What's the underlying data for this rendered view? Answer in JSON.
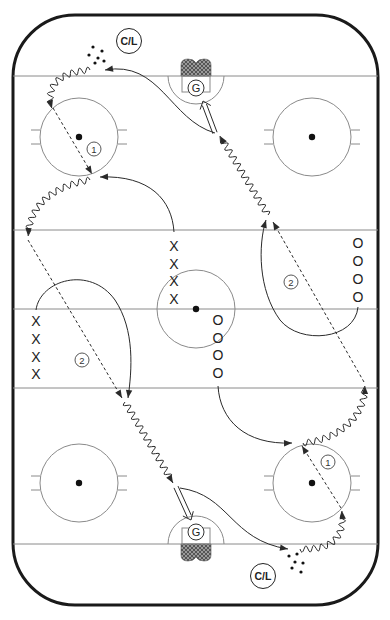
{
  "diagram": {
    "type": "hockey-drill",
    "canvas": {
      "width": 390,
      "height": 620,
      "background": "#ffffff"
    },
    "colors": {
      "boards": "#1a1a1a",
      "rink_lines": "#8a8a8a",
      "paths": "#2a2a2a",
      "net_fill": "#6a6a6a",
      "dot": "#111111"
    },
    "rink": {
      "x": 13,
      "y": 15,
      "width": 365,
      "height": 590,
      "corner_radius": 62
    },
    "lines": [
      {
        "name": "goal-line-top",
        "y": 76
      },
      {
        "name": "blue-line-top",
        "y": 230
      },
      {
        "name": "center-line",
        "y": 309
      },
      {
        "name": "blue-line-bottom",
        "y": 388
      },
      {
        "name": "goal-line-bottom",
        "y": 544
      }
    ],
    "faceoff_circles": [
      {
        "name": "faceoff-circle-top-left",
        "cx": 79,
        "cy": 137,
        "r": 39
      },
      {
        "name": "faceoff-circle-top-right",
        "cx": 312,
        "cy": 137,
        "r": 39
      },
      {
        "name": "faceoff-circle-bottom-left",
        "cx": 79,
        "cy": 483,
        "r": 39
      },
      {
        "name": "faceoff-circle-bottom-right",
        "cx": 312,
        "cy": 483,
        "r": 39
      }
    ],
    "center_circle": {
      "cx": 196,
      "cy": 309,
      "r": 39
    },
    "goals": [
      {
        "name": "goal-top",
        "cx": 196,
        "goal_line_y": 76,
        "dir": 1,
        "goalie_label": "G"
      },
      {
        "name": "goal-bottom",
        "cx": 196,
        "goal_line_y": 544,
        "dir": -1,
        "goalie_label": "G"
      }
    ],
    "coach_markers": [
      {
        "name": "coach-top",
        "label": "C/L",
        "cx": 129,
        "cy": 41
      },
      {
        "name": "coach-bottom",
        "label": "C/L",
        "cx": 263,
        "cy": 576
      }
    ],
    "puck_piles": [
      {
        "name": "pucks-top",
        "dots": [
          [
            93,
            47
          ],
          [
            102,
            51
          ],
          [
            89,
            55
          ],
          [
            98,
            58
          ],
          [
            95,
            63
          ],
          [
            104,
            61
          ]
        ]
      },
      {
        "name": "pucks-bottom",
        "dots": [
          [
            289,
            556
          ],
          [
            297,
            554
          ],
          [
            295,
            562
          ],
          [
            303,
            563
          ],
          [
            292,
            568
          ],
          [
            301,
            572
          ]
        ]
      }
    ],
    "players": [
      {
        "team": "X",
        "label": "X",
        "x": 174,
        "y": 246
      },
      {
        "team": "X",
        "label": "X",
        "x": 174,
        "y": 264
      },
      {
        "team": "X",
        "label": "X",
        "x": 174,
        "y": 281
      },
      {
        "team": "X",
        "label": "X",
        "x": 174,
        "y": 299
      },
      {
        "team": "X",
        "label": "X",
        "x": 36,
        "y": 321
      },
      {
        "team": "X",
        "label": "X",
        "x": 36,
        "y": 339
      },
      {
        "team": "X",
        "label": "X",
        "x": 36,
        "y": 357
      },
      {
        "team": "X",
        "label": "X",
        "x": 36,
        "y": 374
      },
      {
        "team": "O",
        "label": "O",
        "x": 218,
        "y": 320
      },
      {
        "team": "O",
        "label": "O",
        "x": 218,
        "y": 338
      },
      {
        "team": "O",
        "label": "O",
        "x": 218,
        "y": 355
      },
      {
        "team": "O",
        "label": "O",
        "x": 218,
        "y": 373
      },
      {
        "team": "O",
        "label": "O",
        "x": 358,
        "y": 243
      },
      {
        "team": "O",
        "label": "O",
        "x": 358,
        "y": 261
      },
      {
        "team": "O",
        "label": "O",
        "x": 358,
        "y": 279
      },
      {
        "team": "O",
        "label": "O",
        "x": 358,
        "y": 297
      }
    ],
    "step_labels": [
      {
        "label": "1",
        "x": 94,
        "y": 149
      },
      {
        "label": "1",
        "x": 328,
        "y": 462
      },
      {
        "label": "2",
        "x": 82,
        "y": 360
      },
      {
        "label": "2",
        "x": 291,
        "y": 282
      }
    ],
    "legend": {
      "solid": "skate without puck",
      "wavy": "skate with puck",
      "dashed": "pass",
      "double": "shot"
    },
    "paths": [
      {
        "name": "skate-top-curve-to-pucks",
        "style": "solid",
        "arrow": true,
        "d": "M 215 133 C 170 120, 160 60, 105 70"
      },
      {
        "name": "carry-top-corner-down",
        "style": "wavy",
        "arrow": true,
        "d": "M 90 70 C 60 72, 45 85, 52 108"
      },
      {
        "name": "pass-1-top",
        "style": "dashed",
        "arrow": true,
        "d": "M 53 108 L 92 174"
      },
      {
        "name": "skate-x-center-to-receive",
        "style": "solid",
        "arrow": true,
        "d": "M 174 232 C 172 200, 150 175, 100 177"
      },
      {
        "name": "carry-left-to-blueline",
        "style": "wavy",
        "arrow": true,
        "d": "M 90 180 C 60 185, 30 200, 28 236"
      },
      {
        "name": "pass-2-left",
        "style": "dashed",
        "arrow": true,
        "d": "M 28 240 L 122 398"
      },
      {
        "name": "skate-x-left-loop",
        "style": "solid",
        "arrow": true,
        "d": "M 36 310 C 40 280, 90 265, 115 300 C 135 330, 132 370, 128 398"
      },
      {
        "name": "carry-left-to-bottom-net",
        "style": "wavy",
        "arrow": true,
        "d": "M 125 402 L 173 483"
      },
      {
        "name": "shot-bottom",
        "style": "double",
        "arrow": true,
        "d": "M 176 487 L 191 520"
      },
      {
        "name": "skate-bottom-curve-to-pucks",
        "style": "solid",
        "arrow": true,
        "d": "M 180 488 C 230 495, 230 540, 288 549"
      },
      {
        "name": "carry-bottom-corner-up",
        "style": "wavy",
        "arrow": true,
        "d": "M 300 549 C 330 550, 345 540, 342 511"
      },
      {
        "name": "pass-1-bottom",
        "style": "dashed",
        "arrow": true,
        "d": "M 341 508 L 302 446"
      },
      {
        "name": "skate-o-center-to-receive",
        "style": "solid",
        "arrow": true,
        "d": "M 218 386 C 220 420, 245 445, 292 443"
      },
      {
        "name": "carry-right-to-blueline",
        "style": "wavy",
        "arrow": true,
        "d": "M 303 443 C 335 440, 365 420, 365 386"
      },
      {
        "name": "pass-2-right",
        "style": "dashed",
        "arrow": true,
        "d": "M 364 382 L 273 222"
      },
      {
        "name": "skate-o-right-loop",
        "style": "solid",
        "arrow": true,
        "d": "M 358 307 C 355 340, 300 345, 280 320 C 258 290, 258 245, 266 220"
      },
      {
        "name": "carry-right-to-top-net",
        "style": "wavy",
        "arrow": true,
        "d": "M 268 215 L 220 136"
      },
      {
        "name": "shot-top",
        "style": "double",
        "arrow": true,
        "d": "M 215 133 L 203 101"
      }
    ]
  }
}
